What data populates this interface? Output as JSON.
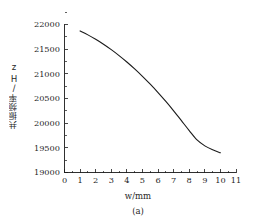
{
  "chart_data": {
    "type": "line",
    "title": "",
    "subtitle": "",
    "caption": "(a)",
    "xlabel": "w/mm",
    "ylabel": "共振频率/Hz",
    "xlim": [
      0,
      11
    ],
    "ylim": [
      19000,
      22000
    ],
    "xticks": [
      0,
      1,
      2,
      3,
      4,
      5,
      6,
      7,
      8,
      9,
      10,
      11
    ],
    "xtick_labels": [
      "0",
      "1",
      "2",
      "3",
      "4",
      "5",
      "6",
      "7",
      "8",
      "9",
      "10",
      "11"
    ],
    "yticks": [
      19000,
      19500,
      20000,
      20500,
      21000,
      21500,
      22000
    ],
    "ytick_labels": [
      "19000",
      "19500",
      "20000",
      "20500",
      "21000",
      "21500",
      "22000"
    ],
    "minor_ticks": true,
    "grid": false,
    "legend": null,
    "spines": [
      "left",
      "bottom"
    ],
    "series": [
      {
        "name": "resonant frequency",
        "color": "#1a1a1a",
        "linewidth": 1.1,
        "marker": "none",
        "x": [
          1.0,
          1.5,
          2.0,
          2.5,
          3.0,
          3.5,
          4.0,
          4.5,
          5.0,
          5.5,
          6.0,
          6.5,
          7.0,
          7.5,
          8.0,
          8.5,
          9.0,
          9.5,
          10.0
        ],
        "y": [
          21870,
          21790,
          21700,
          21600,
          21490,
          21370,
          21240,
          21100,
          20950,
          20790,
          20620,
          20440,
          20250,
          20050,
          19850,
          19660,
          19540,
          19460,
          19400
        ]
      }
    ],
    "annotations": []
  },
  "axes": {
    "y_title": "共振频率/Hz",
    "x_title": "w/mm",
    "figure_caption": "(a)"
  },
  "colors": {
    "background": "#ffffff",
    "axis": "#1a1a1a",
    "curve": "#1a1a1a",
    "text": "#1f1f1f"
  }
}
